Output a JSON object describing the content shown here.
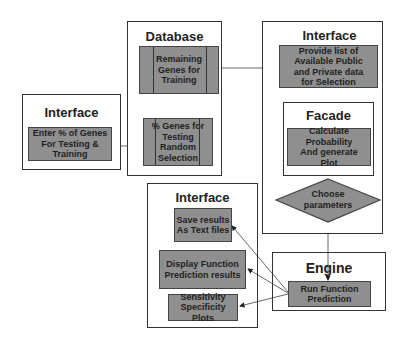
{
  "diagram": {
    "left_interface": {
      "title": "Interface",
      "box": "Enter % of Genes For Testing & Training",
      "lines": [
        "Enter % of Genes",
        "For Testing &",
        "Training"
      ]
    },
    "database": {
      "title": "Database",
      "remaining": {
        "lines": [
          "Remaining Genes for",
          "Training"
        ]
      },
      "testing": {
        "lines": [
          "% Genes for Testing",
          "Random",
          "Selection"
        ]
      }
    },
    "right_interface": {
      "title": "Interface",
      "provide": {
        "lines": [
          "Provide list of",
          "Available Public",
          "and Private data",
          "for Selection"
        ]
      },
      "facade": {
        "title": "Facade",
        "calculate": {
          "lines": [
            "Calculate Probability",
            "And generate",
            "Plot"
          ]
        }
      },
      "decision": {
        "lines": [
          "Choose",
          "parameters"
        ]
      }
    },
    "output_interface": {
      "title": "Interface",
      "save": {
        "lines": [
          "Save results",
          "As Text files"
        ]
      },
      "display": {
        "lines": [
          "Display Function",
          "Prediction results"
        ]
      },
      "plots": {
        "lines": [
          "Sensitivity",
          "Specificity Plots"
        ]
      }
    },
    "engine": {
      "title": "Engine",
      "run": {
        "lines": [
          "Run Function",
          "Prediction"
        ]
      }
    },
    "colors": {
      "box_fill": "#8f8f8f",
      "border": "#333333",
      "background": "#ffffff"
    }
  }
}
